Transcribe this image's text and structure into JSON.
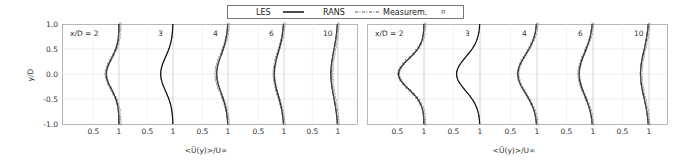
{
  "legend": {
    "items": [
      {
        "label": "LES",
        "style": "solid"
      },
      {
        "label": "RANS",
        "style": "dash-dot"
      },
      {
        "label": "Measurem.",
        "style": "marker"
      }
    ]
  },
  "chart_data": [
    {
      "type": "line",
      "panel": "left",
      "ylabel": "y/D",
      "xlabel": "<Ū(y)>/U∞",
      "ylim": [
        -1.0,
        1.0
      ],
      "yticks": [
        "1.0",
        "0.5",
        "0.0",
        "-0.5",
        "-1.0"
      ],
      "xtick_labels_per_station": [
        "0.5",
        "1"
      ],
      "grid": true,
      "legend_position": "top-center",
      "stations": [
        {
          "label": "x/D = 2",
          "les_min": 0.75,
          "rans_min": 0.76,
          "meas_min": 0.72,
          "has_measurements": true
        },
        {
          "label": "3",
          "les_min": 0.76,
          "rans_min": 0.76,
          "meas_min": null,
          "has_measurements": false
        },
        {
          "label": "4",
          "les_min": 0.78,
          "rans_min": 0.78,
          "meas_min": 0.74,
          "has_measurements": true
        },
        {
          "label": "6",
          "les_min": 0.81,
          "rans_min": 0.81,
          "meas_min": 0.78,
          "has_measurements": true
        },
        {
          "label": "10",
          "les_min": 0.86,
          "rans_min": 0.87,
          "meas_min": 0.86,
          "has_measurements": true
        }
      ],
      "profile_y": [
        -1.0,
        -0.75,
        -0.5,
        -0.25,
        0.0,
        0.25,
        0.5,
        0.75,
        1.0
      ]
    },
    {
      "type": "line",
      "panel": "right",
      "ylabel": "",
      "xlabel": "",
      "ylim": [
        -1.0,
        1.0
      ],
      "xtick_labels_per_station": [
        "0.5",
        "1"
      ],
      "grid": true,
      "stations": [
        {
          "label": "x/D = 2",
          "les_min": 0.52,
          "rans_min": 0.53,
          "meas_min": 0.5,
          "has_measurements": true
        },
        {
          "label": "3",
          "les_min": 0.56,
          "rans_min": 0.56,
          "meas_min": null,
          "has_measurements": false
        },
        {
          "label": "4",
          "les_min": 0.64,
          "rans_min": 0.64,
          "meas_min": 0.62,
          "has_measurements": true
        },
        {
          "label": "6",
          "les_min": 0.74,
          "rans_min": 0.74,
          "meas_min": 0.71,
          "has_measurements": true
        },
        {
          "label": "10",
          "les_min": 0.84,
          "rans_min": 0.84,
          "meas_min": 0.83,
          "has_measurements": true
        }
      ],
      "profile_y": [
        -1.0,
        -0.75,
        -0.5,
        -0.25,
        0.0,
        0.25,
        0.5,
        0.75,
        1.0
      ]
    }
  ],
  "axes": {
    "xlabel": "<Ū(y)>/U∞",
    "ylabel": "y/D"
  }
}
